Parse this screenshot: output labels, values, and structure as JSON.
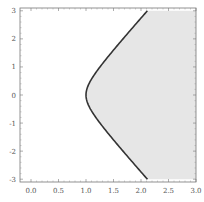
{
  "chart_data": {
    "type": "area",
    "title": "",
    "xlabel": "",
    "ylabel": "",
    "xlim": [
      -0.2,
      3.0
    ],
    "ylim": [
      -3.1,
      3.1
    ],
    "grid": false,
    "legend": null,
    "x_ticks": [
      "0.0",
      "0.5",
      "1.0",
      "1.5",
      "2.0",
      "2.5",
      "3.0"
    ],
    "y_ticks": [
      "-3",
      "-2",
      "-1",
      "0",
      "1",
      "2",
      "3"
    ],
    "series": [
      {
        "name": "boundary curve",
        "description": "hyperbola-like boundary x = sqrt(1 + (y/1.35)^2) approx, vertex at (1.0, 0)",
        "points": [
          [
            2.48,
            -3.0
          ],
          [
            2.15,
            -2.5
          ],
          [
            1.85,
            -2.0
          ],
          [
            1.55,
            -1.5
          ],
          [
            1.28,
            -1.0
          ],
          [
            1.08,
            -0.5
          ],
          [
            1.0,
            0.0
          ],
          [
            1.08,
            0.5
          ],
          [
            1.28,
            1.0
          ],
          [
            1.55,
            1.5
          ],
          [
            1.85,
            2.0
          ],
          [
            2.15,
            2.5
          ],
          [
            2.48,
            3.0
          ]
        ],
        "color": "#333333"
      }
    ],
    "filled_region": {
      "description": "region to the right of the curve shaded light gray",
      "color": "#e6e6e6"
    }
  },
  "colors": {
    "fill": "#e6e6e6",
    "curve": "#333333",
    "frame": "#777777"
  }
}
